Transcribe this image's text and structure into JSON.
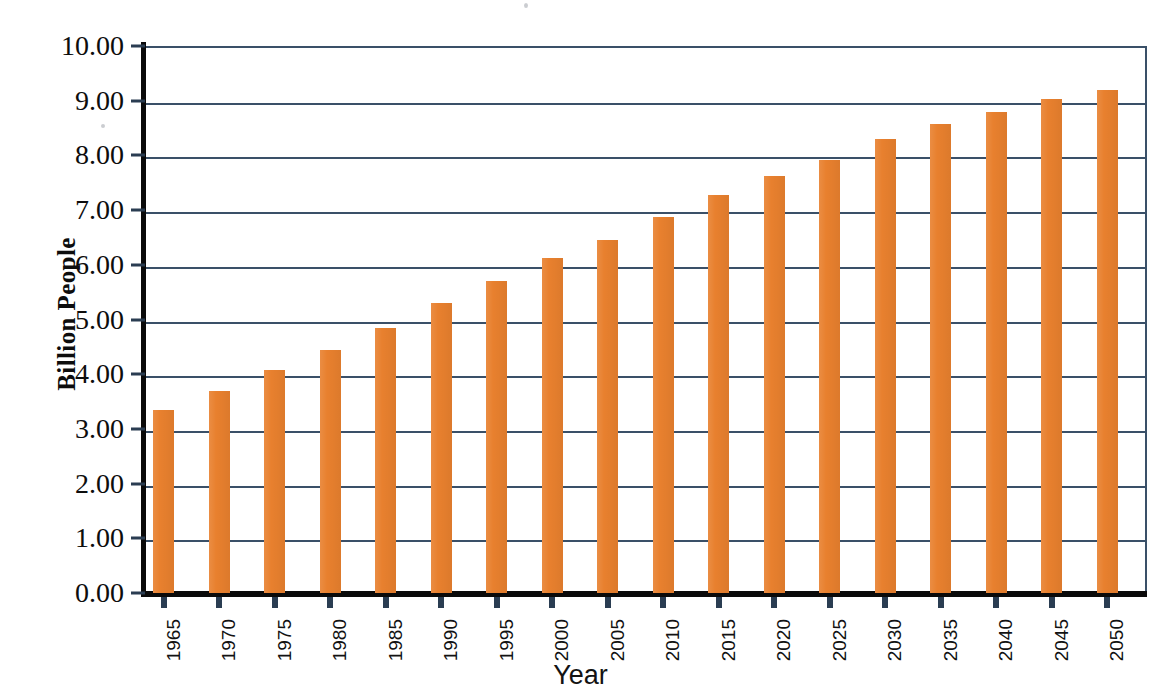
{
  "chart_data": {
    "type": "bar",
    "title": "",
    "subtitle": "",
    "xlabel": "Year",
    "ylabel": "Billion People",
    "categories": [
      "1965",
      "1970",
      "1975",
      "1980",
      "1985",
      "1990",
      "1995",
      "2000",
      "2005",
      "2010",
      "2015",
      "2020",
      "2025",
      "2030",
      "2035",
      "2040",
      "2045",
      "2050"
    ],
    "values": [
      3.34,
      3.7,
      4.08,
      4.45,
      4.84,
      5.3,
      5.7,
      6.12,
      6.46,
      6.88,
      7.28,
      7.62,
      7.92,
      8.3,
      8.58,
      8.8,
      9.03,
      9.19
    ],
    "ylim": [
      0,
      10
    ],
    "ytick_step": 1,
    "ytick_labels": [
      "0.00",
      "1.00",
      "2.00",
      "3.00",
      "4.00",
      "5.00",
      "6.00",
      "7.00",
      "8.00",
      "9.00",
      "10.00"
    ],
    "ytick_values": [
      0,
      1,
      2,
      3,
      4,
      5,
      6,
      7,
      8,
      9,
      10
    ],
    "grid": true,
    "grid_axis": "y",
    "legend": false,
    "legend_position": "none",
    "series": [
      {
        "name": "World Population",
        "values": [
          3.34,
          3.7,
          4.08,
          4.45,
          4.84,
          5.3,
          5.7,
          6.12,
          6.46,
          6.88,
          7.28,
          7.62,
          7.92,
          8.3,
          8.58,
          8.8,
          9.03,
          9.19
        ]
      }
    ]
  },
  "colors": {
    "bar": "#e8802e",
    "gridline": "#3a5068",
    "axis_spine": "#0a0a0a",
    "tick_mark": "#2a3d52",
    "text": "#0d0d0d",
    "background": "#ffffff"
  }
}
